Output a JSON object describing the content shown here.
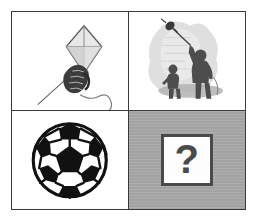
{
  "puzzle": {
    "type": "visual-analogy-grid",
    "rows": 2,
    "columns": 2,
    "frame_color": "#3a3a3a",
    "cells": [
      {
        "position": "top-left",
        "name": "kite-in-hand",
        "description": "Hand gripping the string of a diamond kite",
        "background": "#ffffff",
        "alt": "kite held in hand"
      },
      {
        "position": "top-right",
        "name": "person-flying-kite",
        "description": "Adult with raised arm flying a kite while a child watches",
        "background": "#ffffff",
        "alt": "person flying a kite"
      },
      {
        "position": "bottom-left",
        "name": "soccer-ball",
        "description": "Black and white soccer ball",
        "background": "#ffffff",
        "alt": "soccer ball"
      },
      {
        "position": "bottom-right",
        "name": "answer-placeholder",
        "description": "Gray cell with a white box containing a question mark",
        "background": "#a9a9a9",
        "answer_symbol": "?",
        "alt": "unknown answer"
      }
    ]
  }
}
